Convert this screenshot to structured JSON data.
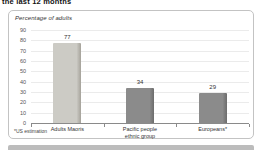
{
  "header": {
    "title": "the last 12 months"
  },
  "chart_data": {
    "type": "bar",
    "title": "the last 12 months",
    "ylabel": "Percentage of adults",
    "xlabel": "",
    "categories": [
      "Adults Maoris",
      "Pacific people\nethnic group",
      "Europeans*"
    ],
    "values": [
      77,
      34,
      29
    ],
    "ylim": [
      0,
      90
    ],
    "ytick_step": 10,
    "grid": true,
    "legend_position": "none",
    "bar_colors": [
      "#cccbc5",
      "#8b8b8b",
      "#8b8b8b"
    ],
    "bar_edge_colors": [
      "#a5a29a",
      "#6c6c6c",
      "#6c6c6c"
    ],
    "footnote": "*US estimation",
    "panel_border_color": "#c3c3c3",
    "gridline_color": "#ebebeb",
    "axis_color": "#8a8a8a"
  }
}
